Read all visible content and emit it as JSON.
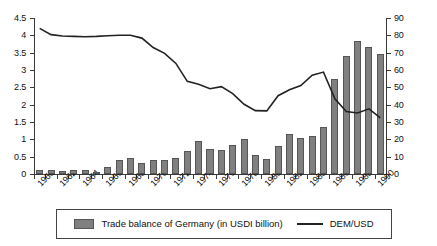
{
  "chart_data": {
    "type": "bar",
    "title": "",
    "subtitle": "",
    "xlabel": "",
    "ylabel": "",
    "y2label": "",
    "grid": false,
    "legend_position": "bottom",
    "x": [
      1960,
      1961,
      1962,
      1963,
      1964,
      1965,
      1966,
      1967,
      1968,
      1969,
      1970,
      1971,
      1972,
      1973,
      1974,
      1975,
      1976,
      1977,
      1978,
      1979,
      1980,
      1981,
      1982,
      1983,
      1984,
      1985,
      1986,
      1987,
      1988,
      1989,
      1990
    ],
    "categories": [
      "1960",
      "1961",
      "1962",
      "1963",
      "1964",
      "1965",
      "1966",
      "1967",
      "1968",
      "1969",
      "1970",
      "1971",
      "1972",
      "1973",
      "1974",
      "1975",
      "1976",
      "1977",
      "1978",
      "1979",
      "1980",
      "1981",
      "1982",
      "1983",
      "1984",
      "1985",
      "1986",
      "1987",
      "1988",
      "1989",
      "1990"
    ],
    "xtick_labels": [
      "1960",
      "1962",
      "1964",
      "1966",
      "1968",
      "1970",
      "1972",
      "1974",
      "1976",
      "1978",
      "1980",
      "1982",
      "1988",
      "1986",
      "1988",
      "1990"
    ],
    "xtick_years": [
      1960,
      1962,
      1964,
      1966,
      1968,
      1970,
      1972,
      1974,
      1976,
      1978,
      1980,
      1982,
      1984,
      1986,
      1988,
      1990
    ],
    "ylim": [
      0,
      4.5
    ],
    "ytick_labels": [
      "0",
      "0.5",
      "1",
      "1.5",
      "2",
      "2.5",
      "3",
      "3.5",
      "4",
      "4.5"
    ],
    "ytick_values": [
      0,
      0.5,
      1,
      1.5,
      2,
      2.5,
      3,
      3.5,
      4,
      4.5
    ],
    "y2lim": [
      0,
      90
    ],
    "y2tick_labels": [
      "0",
      "10",
      "20",
      "30",
      "40",
      "50",
      "60",
      "70",
      "80",
      "90"
    ],
    "y2tick_values": [
      0,
      10,
      20,
      30,
      40,
      50,
      60,
      70,
      80,
      90
    ],
    "series": [
      {
        "name": "Trade balance of Germany (in USDI billion)",
        "type": "bar",
        "axis": "right",
        "color": "#808080",
        "values": [
          2.5,
          2.5,
          1.8,
          2.6,
          2.6,
          1.3,
          4.0,
          8.0,
          9.0,
          6.5,
          8.0,
          8.0,
          9.5,
          13.0,
          19.0,
          14.5,
          14.0,
          16.5,
          20.0,
          11.0,
          8.5,
          16.0,
          23.0,
          20.5,
          22.0,
          27.0,
          55.0,
          68.0,
          77.0,
          73.0,
          69.0
        ]
      },
      {
        "name": "DEM/USD",
        "type": "line",
        "axis": "left",
        "color": "#222222",
        "values": [
          4.2,
          4.02,
          3.98,
          3.97,
          3.96,
          3.97,
          3.99,
          4.0,
          4.0,
          3.92,
          3.65,
          3.48,
          3.19,
          2.67,
          2.59,
          2.46,
          2.52,
          2.32,
          2.01,
          1.83,
          1.82,
          2.26,
          2.43,
          2.55,
          2.85,
          2.94,
          2.17,
          1.8,
          1.76,
          1.88,
          1.62
        ]
      }
    ]
  },
  "legend": {
    "bar_label": "Trade balance of Germany (in USDI billion)",
    "line_label": "DEM/USD"
  }
}
